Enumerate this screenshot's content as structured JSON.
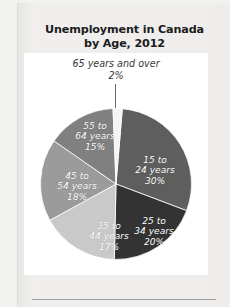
{
  "title": {
    "line1": "Unemployment in Canada",
    "line2": "by Age, 2012"
  },
  "callout": {
    "label": "65 years and over",
    "value": "2%"
  },
  "colors": {
    "slice_15_24": "#5e5e5e",
    "slice_25_34": "#333333",
    "slice_35_44": "#c9c9c9",
    "slice_45_54": "#9b9b9b",
    "slice_55_64": "#808080",
    "slice_65_over": "#f4f4f4",
    "plot_background": "#ffffff",
    "page_background": "#eeedeb",
    "title_text": "#1c1c1c",
    "rule": "#9e9e9e",
    "leader_line": "#6d6d6d"
  },
  "chart_data": {
    "type": "pie",
    "title": "Unemployment in Canada by Age, 2012",
    "xlabel": "",
    "ylabel": "",
    "units": "percent",
    "legend": "none",
    "labels_inside_slices": true,
    "categories": [
      "15 to 24 years",
      "25 to 34 years",
      "35 to 44 years",
      "45 to 54 years",
      "55 to 64 years",
      "65 years and over"
    ],
    "values": [
      30,
      20,
      17,
      18,
      15,
      2
    ],
    "slices": [
      {
        "name": "15 to 24 years",
        "label_line1": "15 to",
        "label_line2": "24 years",
        "value": 30,
        "value_label": "30%",
        "color": "#5e5e5e",
        "start_angle": 4.8,
        "end_angle": 112.8,
        "label_position": "inside"
      },
      {
        "name": "25 to 34 years",
        "label_line1": "25 to",
        "label_line2": "34 years",
        "value": 20,
        "value_label": "20%",
        "color": "#333333",
        "start_angle": 112.8,
        "end_angle": 184.8,
        "label_position": "inside"
      },
      {
        "name": "35 to 44 years",
        "label_line1": "35 to",
        "label_line2": "44 years",
        "value": 17,
        "value_label": "17%",
        "color": "#c9c9c9",
        "start_angle": 184.8,
        "end_angle": 246.0,
        "label_position": "inside"
      },
      {
        "name": "45 to 54 years",
        "label_line1": "45 to",
        "label_line2": "54 years",
        "value": 18,
        "value_label": "18%",
        "color": "#9b9b9b",
        "start_angle": 246.0,
        "end_angle": 310.8,
        "label_position": "inside"
      },
      {
        "name": "55 to 64 years",
        "label_line1": "55 to",
        "label_line2": "64 years",
        "value": 15,
        "value_label": "15%",
        "color": "#808080",
        "start_angle": 310.8,
        "end_angle": 358.8,
        "label_position": "inside"
      },
      {
        "name": "65 years and over",
        "label_line1": "65 years and over",
        "label_line2": "",
        "value": 2,
        "value_label": "2%",
        "color": "#f4f4f4",
        "start_angle": 358.8,
        "end_angle": 4.8,
        "label_position": "callout-above"
      }
    ],
    "total": 102
  }
}
